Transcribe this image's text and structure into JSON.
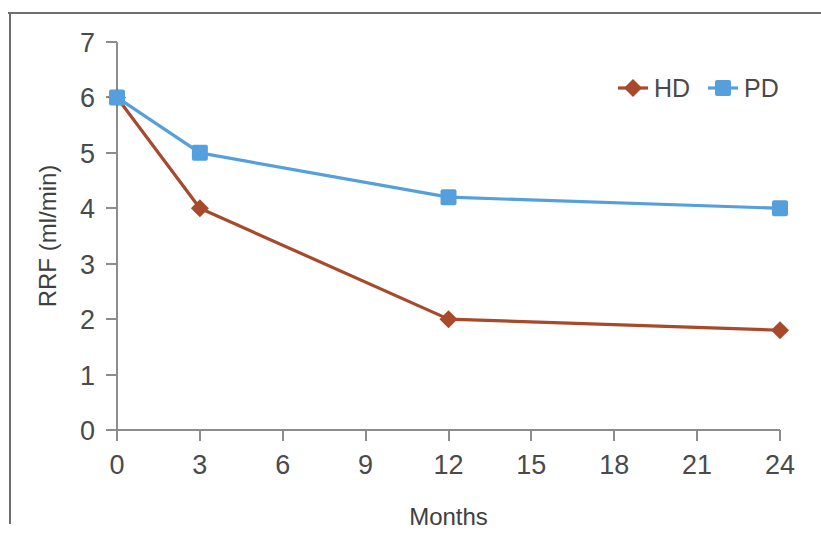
{
  "figure": {
    "background_color": "#ffffff",
    "border_color": "#6e6e6e"
  },
  "chart_data": {
    "type": "line",
    "title": "",
    "xlabel": "Months",
    "ylabel": "RRF (ml/min)",
    "x": [
      0,
      3,
      12,
      24
    ],
    "xlim": [
      0,
      24
    ],
    "ylim": [
      0,
      7
    ],
    "xticks": [
      "0",
      "3",
      "6",
      "9",
      "12",
      "15",
      "18",
      "21",
      "24"
    ],
    "xtick_values": [
      0,
      3,
      6,
      9,
      12,
      15,
      18,
      21,
      24
    ],
    "yticks": [
      "0",
      "1",
      "2",
      "3",
      "4",
      "5",
      "6",
      "7"
    ],
    "ytick_values": [
      0,
      1,
      2,
      3,
      4,
      5,
      6,
      7
    ],
    "grid": false,
    "legend_position": "top-right",
    "series": [
      {
        "name": "HD",
        "color": "#a8492c",
        "marker": "diamond",
        "values": [
          6.0,
          4.0,
          2.0,
          1.8
        ]
      },
      {
        "name": "PD",
        "color": "#55a0dc",
        "marker": "square",
        "values": [
          6.0,
          5.0,
          4.2,
          4.0
        ]
      }
    ]
  },
  "legend": {
    "entries": [
      {
        "label": "HD",
        "color": "#a8492c",
        "marker": "diamond"
      },
      {
        "label": "PD",
        "color": "#55a0dc",
        "marker": "square"
      }
    ]
  }
}
